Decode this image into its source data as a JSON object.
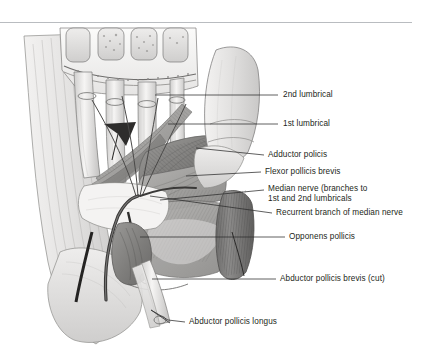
{
  "figure": {
    "background_color": "#ffffff",
    "text_color": "#231f20",
    "leader_line_color": "#2b2b2b",
    "rule_color": "#b9bcc0"
  },
  "labels": [
    {
      "id": "second-lumbrical",
      "text": "2nd lumbrical",
      "x": 283,
      "y": 90,
      "leader": {
        "x1": 258,
        "y1": 95,
        "x2": 278,
        "y2": 95
      }
    },
    {
      "id": "first-lumbrical",
      "text": "1st lumbrical",
      "x": 283,
      "y": 119,
      "leader": {
        "x1": 258,
        "y1": 124,
        "x2": 278,
        "y2": 124
      }
    },
    {
      "id": "adductor-policis",
      "text": "Adductor policis",
      "x": 268,
      "y": 150,
      "leader": {
        "x1": 252,
        "y1": 155,
        "x2": 264,
        "y2": 155
      }
    },
    {
      "id": "flexor-pollicis-brevis",
      "text": "Flexor pollicis brevis",
      "x": 265,
      "y": 167,
      "leader": {
        "x1": 250,
        "y1": 172,
        "x2": 261,
        "y2": 172
      }
    },
    {
      "id": "median-nerve",
      "text": "Median nerve (branches to\n1st and 2nd lumbricals",
      "x": 268,
      "y": 185,
      "leader": {
        "x1": 252,
        "y1": 190,
        "x2": 264,
        "y2": 190
      }
    },
    {
      "id": "recurrent-branch",
      "text": "Recurrent branch of median nerve",
      "x": 276,
      "y": 208,
      "leader": {
        "x1": 256,
        "y1": 213,
        "x2": 272,
        "y2": 213
      }
    },
    {
      "id": "opponens-pollicis",
      "text": "Opponens pollicis",
      "x": 289,
      "y": 232,
      "leader": {
        "x1": 221,
        "y1": 237,
        "x2": 285,
        "y2": 237
      }
    },
    {
      "id": "abductor-pollicis-brevis",
      "text": "Abductor pollicis brevis (cut)",
      "x": 280,
      "y": 274,
      "leader": {
        "x1": 152,
        "y1": 279,
        "x2": 276,
        "y2": 279
      }
    },
    {
      "id": "abductor-pollicis-longus",
      "text": "Abductor pollicis longus",
      "x": 189,
      "y": 317,
      "leader": {
        "x1": 161,
        "y1": 322,
        "x2": 185,
        "y2": 322
      }
    }
  ],
  "illustration": {
    "name": "palmar-hand-dissection",
    "style": "grayscale medical line-and-tone drawing",
    "structures": [
      "flexor tendons of digits 2-5",
      "lumbrical muscles",
      "transverse carpal ligament",
      "thenar eminence muscles",
      "adductor pollicis",
      "flexor pollicis brevis",
      "opponens pollicis",
      "abductor pollicis brevis (reflected/cut)",
      "abductor pollicis longus tendon",
      "median nerve and recurrent branch",
      "probe arrowhead in mid-palm"
    ]
  }
}
